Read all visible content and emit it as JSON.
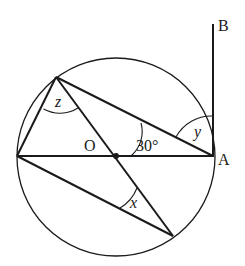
{
  "diagram": {
    "type": "circle-geometry",
    "circle": {
      "cx": 116,
      "cy": 157,
      "r": 99
    },
    "points": {
      "O": {
        "x": 116,
        "y": 156,
        "label": "O"
      },
      "A": {
        "x": 213,
        "y": 156,
        "label": "A"
      },
      "B": {
        "x": 213,
        "y": 24,
        "label": "B"
      },
      "L": {
        "x": 17,
        "y": 156
      },
      "T": {
        "x": 56,
        "y": 77
      },
      "D": {
        "x": 173,
        "y": 236
      }
    },
    "labels": {
      "O": "O",
      "A": "A",
      "B": "B",
      "angle_30": "30°",
      "angle_x": "x",
      "angle_y": "y",
      "angle_z": "z"
    },
    "colors": {
      "stroke": "#1a1a1a",
      "background": "#ffffff"
    }
  }
}
